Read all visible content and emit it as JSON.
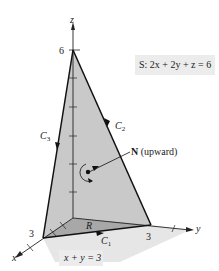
{
  "figure": {
    "surface_equation": "S: 2x + 2y + z = 6",
    "region_equation": "x + y = 3",
    "axes": {
      "x": "x",
      "y": "y",
      "z": "z"
    },
    "intercepts": {
      "x": "3",
      "y": "3",
      "z": "6"
    },
    "curves": {
      "c1": {
        "letter": "C",
        "index": "1"
      },
      "c2": {
        "letter": "C",
        "index": "2"
      },
      "c3": {
        "letter": "C",
        "index": "3"
      }
    },
    "region_label": "R",
    "normal_label": {
      "bold": "N",
      "text": " (upward)"
    }
  },
  "colors": {
    "surface_fill": "#c8c8c8",
    "region_fill": "#a9a9a9",
    "shadow_fill": "#e3e3e3",
    "line": "#111111"
  }
}
